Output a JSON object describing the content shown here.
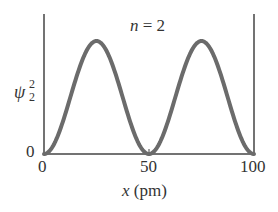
{
  "chart_data": {
    "type": "line",
    "title": "",
    "annotation": {
      "var": "n",
      "rest": " = 2"
    },
    "xlabel": {
      "var": "x",
      "unit": " (pm)"
    },
    "ylabel": {
      "base": "ψ",
      "sup": "2",
      "sub": "2"
    },
    "xlim": [
      0,
      100
    ],
    "ylim": [
      0,
      1
    ],
    "x_ticks": [
      "0",
      "50",
      "100"
    ],
    "y_ticks": [
      "0"
    ],
    "grid": false,
    "legend": null,
    "series": [
      {
        "name": "psi_2 squared",
        "function": "sin^2(2*pi*x/100)",
        "x": [
          0,
          5,
          10,
          15,
          20,
          25,
          30,
          35,
          40,
          45,
          50,
          55,
          60,
          65,
          70,
          75,
          80,
          85,
          90,
          95,
          100
        ],
        "values": [
          0,
          0.095,
          0.345,
          0.655,
          0.905,
          1.0,
          0.905,
          0.655,
          0.345,
          0.095,
          0,
          0.095,
          0.345,
          0.655,
          0.905,
          1.0,
          0.905,
          0.655,
          0.345,
          0.095,
          0
        ]
      }
    ],
    "colors": {
      "curve": "#6b6b6b",
      "axis": "#444444",
      "text": "#333333"
    }
  }
}
